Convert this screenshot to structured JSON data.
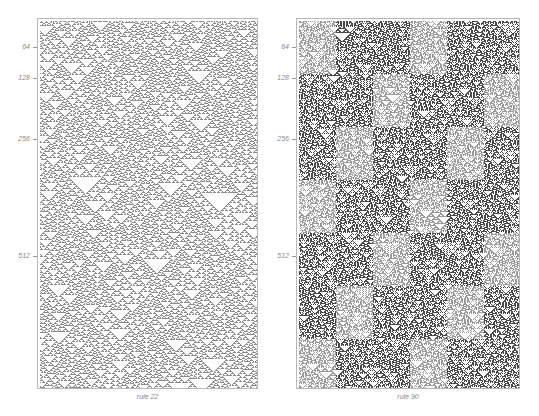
{
  "figure": {
    "panels": [
      {
        "id": "rule22",
        "caption": "rule 22",
        "rule": 22,
        "ticks": [
          {
            "label": "64",
            "row": 64
          },
          {
            "label": "128",
            "row": 128
          },
          {
            "label": "256",
            "row": 256
          },
          {
            "label": "512",
            "row": 512
          }
        ],
        "cell_color": "#8c8c8c"
      },
      {
        "id": "rule90",
        "caption": "rule 90",
        "rule": 90,
        "ticks": [
          {
            "label": "64",
            "row": 64
          },
          {
            "label": "128",
            "row": 128
          },
          {
            "label": "256",
            "row": 256
          },
          {
            "label": "512",
            "row": 512
          }
        ],
        "cell_color": "#4a4a4a"
      }
    ],
    "frame_color": "#b8b8b8",
    "label_color": "#8a8a8a"
  }
}
